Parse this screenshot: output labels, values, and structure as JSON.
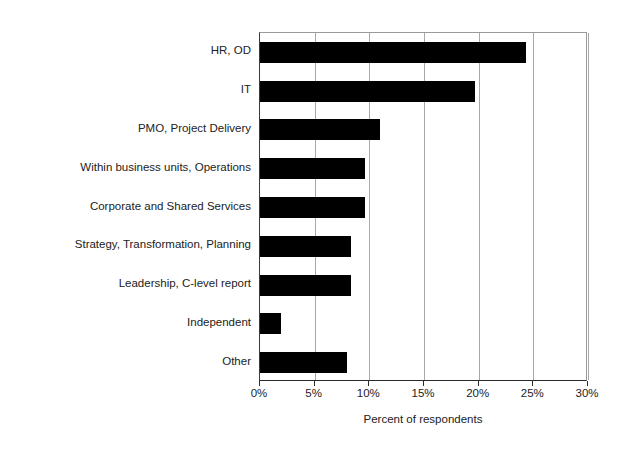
{
  "chart_data": {
    "type": "bar",
    "orientation": "horizontal",
    "title": "",
    "subtitle": "",
    "xlabel": "Percent of respondents",
    "ylabel": "",
    "categories": [
      "HR, OD",
      "IT",
      "PMO, Project Delivery",
      "Within business units, Operations",
      "Corporate and Shared Services",
      "Strategy, Transformation, Planning",
      "Leadership, C-level report",
      "Independent",
      "Other"
    ],
    "values": [
      24.3,
      19.7,
      11.0,
      9.6,
      9.6,
      8.3,
      8.3,
      1.9,
      8.0
    ],
    "value_unit": "%",
    "xlim": [
      0,
      30
    ],
    "xticks": [
      0,
      5,
      10,
      15,
      20,
      25,
      30
    ],
    "xtick_labels": [
      "0%",
      "5%",
      "10%",
      "15%",
      "20%",
      "25%",
      "30%"
    ],
    "grid": "vertical",
    "legend": "none",
    "bar_color": "#000000",
    "axis_color": "#2b2b2b",
    "gridline_color": "#a8a8a8",
    "background_color": "#ffffff"
  }
}
